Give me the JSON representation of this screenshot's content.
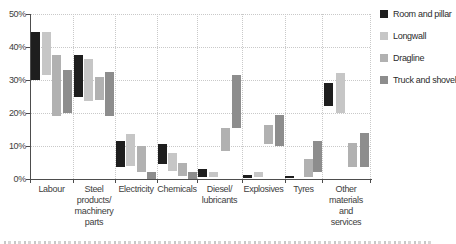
{
  "chart_data": {
    "type": "bar",
    "subtype": "floating-range-bars",
    "title": "",
    "unit": "%",
    "ylim": [
      0,
      50
    ],
    "yticks": [
      "0%",
      "10%",
      "20%",
      "30%",
      "40%",
      "50%"
    ],
    "grid": "dotted",
    "legend_position": "top-right",
    "categories": [
      "Labour",
      "Steel products/ machinery parts",
      "Electricity",
      "Chemicals",
      "Diesel/ lubricants",
      "Explosives",
      "Tyres",
      "Other materials and services"
    ],
    "category_labels_wrapped": [
      "Labour",
      "Steel\nproducts/\nmachinery\nparts",
      "Electricity",
      "Chemicals",
      "Diesel/\nlubricants",
      "Explosives",
      "Tyres",
      "Other\nmaterials\nand\nservices"
    ],
    "series": [
      {
        "name": "Room and pillar",
        "color": "#1e1e1e",
        "ranges": [
          [
            30,
            44.5
          ],
          [
            25,
            37.5
          ],
          [
            3.5,
            11.5
          ],
          [
            4.5,
            10.5
          ],
          [
            0.5,
            3
          ],
          [
            0.3,
            1.2
          ],
          [
            0.2,
            1
          ],
          [
            22,
            29
          ]
        ]
      },
      {
        "name": "Longwall",
        "color": "#c6c6c6",
        "ranges": [
          [
            31.5,
            44.5
          ],
          [
            23.5,
            36.5
          ],
          [
            4,
            13.5
          ],
          [
            2.5,
            8
          ],
          [
            0.5,
            2
          ],
          [
            0.5,
            2
          ],
          null,
          [
            20,
            32
          ]
        ]
      },
      {
        "name": "Dragline",
        "color": "#b1b1b1",
        "ranges": [
          [
            19,
            37.5
          ],
          [
            24,
            31
          ],
          [
            2,
            10
          ],
          [
            1,
            5
          ],
          [
            8.5,
            15.5
          ],
          [
            10.5,
            16.5
          ],
          [
            0.5,
            6
          ],
          [
            3.5,
            11
          ]
        ]
      },
      {
        "name": "Truck and shovel",
        "color": "#8d8d8d",
        "ranges": [
          [
            20,
            33
          ],
          [
            19,
            32.5
          ],
          [
            0,
            2
          ],
          [
            0,
            2
          ],
          [
            15.5,
            31.5
          ],
          [
            10,
            19.5
          ],
          [
            2,
            11.5
          ],
          [
            3.5,
            14
          ]
        ]
      }
    ]
  },
  "colors": {
    "background": "#ffffff",
    "axis": "#4d4d4d",
    "grid": "#c9c9c9",
    "tick_label": "#3d3d3d"
  }
}
